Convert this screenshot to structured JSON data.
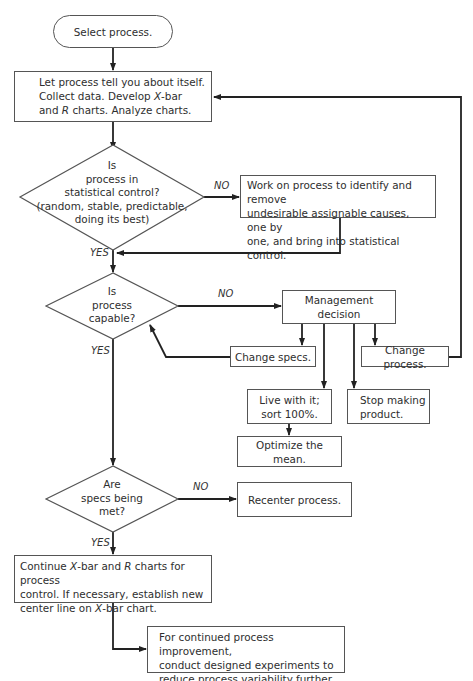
{
  "diagram": {
    "start": "Select process.",
    "collect": {
      "line1": "Let process tell you about itself.",
      "line2a": "Collect data. Develop ",
      "line2i": "X",
      "line2b": "-bar",
      "line3a": "and ",
      "line3i": "R",
      "line3b": " charts. Analyze charts."
    },
    "decision_control": {
      "lines": [
        "Is",
        "process in",
        "statistical control?",
        "(random, stable, predictable,",
        "doing its best)"
      ]
    },
    "work_on_process": {
      "lines": [
        "Work on process to identify and remove",
        "undesirable assignable causes, one by",
        "one, and bring into statistical control."
      ]
    },
    "decision_capable": {
      "lines": [
        "Is",
        "process",
        "capable?"
      ]
    },
    "management_decision": "Management decision",
    "change_specs": "Change specs.",
    "change_process": "Change process.",
    "live_with_it": {
      "lines": [
        "Live with it;",
        "sort 100%."
      ]
    },
    "stop_making": {
      "lines": [
        "Stop making",
        "product."
      ]
    },
    "optimize_mean": "Optimize the mean.",
    "decision_specs_met": {
      "lines": [
        "Are",
        "specs being",
        "met?"
      ]
    },
    "recenter": "Recenter process.",
    "continue_charts": {
      "line1a": "Continue ",
      "line1i": "X",
      "line1b": "-bar and ",
      "line1i2": "R",
      "line1c": " charts for process",
      "line2": "control. If necessary, establish new",
      "line3a": "center line on ",
      "line3i": "X",
      "line3b": "-bar chart."
    },
    "improvement": {
      "lines": [
        "For continued process improvement,",
        "conduct designed experiments to",
        "reduce process variability further."
      ]
    },
    "labels": {
      "no1": "NO",
      "yes1": "YES",
      "no2": "NO",
      "yes2": "YES",
      "no3": "NO",
      "yes3": "YES"
    }
  }
}
